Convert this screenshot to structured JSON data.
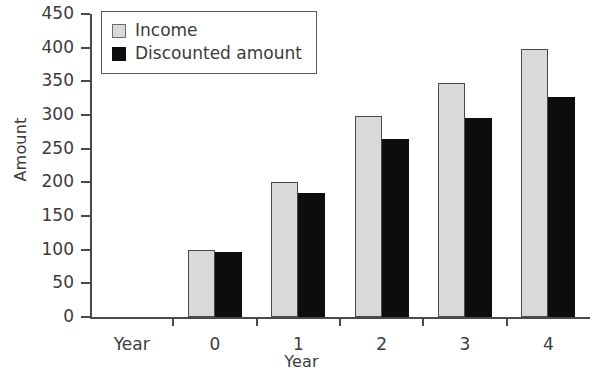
{
  "chart_data": {
    "type": "bar",
    "title": "",
    "xlabel": "Year",
    "ylabel": "Amount",
    "categories": [
      "Year",
      "0",
      "1",
      "2",
      "3",
      "4"
    ],
    "series": [
      {
        "name": "Income",
        "color": "#d9d9d9",
        "values": [
          null,
          100,
          200,
          298,
          348,
          398
        ]
      },
      {
        "name": "Discounted amount",
        "color": "#0d0d0d",
        "values": [
          null,
          96,
          184,
          265,
          296,
          326
        ]
      }
    ],
    "ylim": [
      0,
      450
    ],
    "ytick_step": 50,
    "yticks": [
      "0",
      "50",
      "100",
      "150",
      "200",
      "250",
      "300",
      "350",
      "400",
      "450"
    ],
    "grid": false,
    "legend_position": "top-left"
  },
  "legend": {
    "items": [
      {
        "label": "Income"
      },
      {
        "label": "Discounted amount"
      }
    ]
  }
}
